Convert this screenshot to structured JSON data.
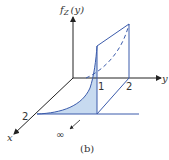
{
  "figure": {
    "caption": "(b)",
    "axes": {
      "vertical_label": "f",
      "vertical_subscript": "Z",
      "vertical_arg": "(y)",
      "y_label": "y",
      "x_label": "x"
    },
    "ticks": {
      "y_tick_1": "1",
      "y_tick_2": "2",
      "x_tick_2": "2"
    },
    "infinity_label": "∞",
    "colors": {
      "axis": "#222222",
      "surface_line": "#3b5bab",
      "shaded_fill": "#c7daf0",
      "text": "#333333"
    }
  }
}
